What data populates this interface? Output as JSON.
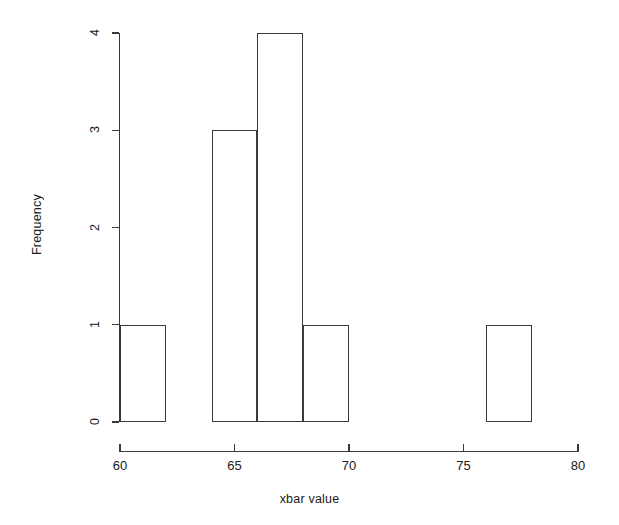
{
  "chart_data": {
    "type": "bar",
    "title": "",
    "subtitle": "",
    "xlabel": "xbar value",
    "ylabel": "Frequency",
    "xlim": [
      60,
      80
    ],
    "ylim": [
      0,
      4
    ],
    "bin_width": 2,
    "grid": false,
    "legend": null,
    "x_ticks": [
      60,
      65,
      70,
      75,
      80
    ],
    "y_ticks": [
      0,
      1,
      2,
      3,
      4
    ],
    "x_tick_labels": [
      "60",
      "65",
      "70",
      "75",
      "80"
    ],
    "y_tick_labels": [
      "0",
      "1",
      "2",
      "3",
      "4"
    ],
    "bins": [
      {
        "start": 60,
        "end": 62,
        "label": "60-62",
        "value": 1
      },
      {
        "start": 62,
        "end": 64,
        "label": "62-64",
        "value": 0
      },
      {
        "start": 64,
        "end": 66,
        "label": "64-66",
        "value": 3
      },
      {
        "start": 66,
        "end": 68,
        "label": "66-68",
        "value": 4
      },
      {
        "start": 68,
        "end": 70,
        "label": "68-70",
        "value": 1
      },
      {
        "start": 70,
        "end": 72,
        "label": "70-72",
        "value": 0
      },
      {
        "start": 72,
        "end": 74,
        "label": "72-74",
        "value": 0
      },
      {
        "start": 74,
        "end": 76,
        "label": "74-76",
        "value": 0
      },
      {
        "start": 76,
        "end": 78,
        "label": "76-78",
        "value": 1
      }
    ],
    "categories": [
      "60-62",
      "62-64",
      "64-66",
      "66-68",
      "68-70",
      "70-72",
      "72-74",
      "74-76",
      "76-78"
    ],
    "values": [
      1,
      0,
      3,
      4,
      1,
      0,
      0,
      0,
      1
    ],
    "total_count": 10,
    "colors": {
      "background": "#ffffff",
      "bar_fill": "transparent",
      "bar_border": "#3a3a3a",
      "axis": "#3a3a3a",
      "text": "#111111"
    }
  }
}
